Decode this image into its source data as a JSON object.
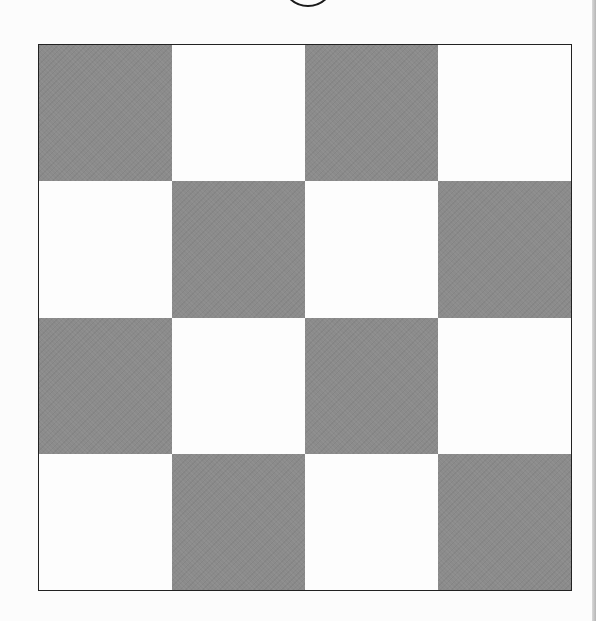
{
  "figure": {
    "type": "checkerboard",
    "rows": 4,
    "cols": 4,
    "colors": {
      "dark": "#8b8b8b",
      "light": "#fdfdfd",
      "border": "#222222",
      "background": "#fcfcfc"
    },
    "pattern": [
      [
        "dark",
        "light",
        "dark",
        "light"
      ],
      [
        "light",
        "dark",
        "light",
        "dark"
      ],
      [
        "dark",
        "light",
        "dark",
        "light"
      ],
      [
        "light",
        "dark",
        "light",
        "dark"
      ]
    ],
    "top_marker": {
      "shape": "circle",
      "partially_visible": true
    }
  }
}
